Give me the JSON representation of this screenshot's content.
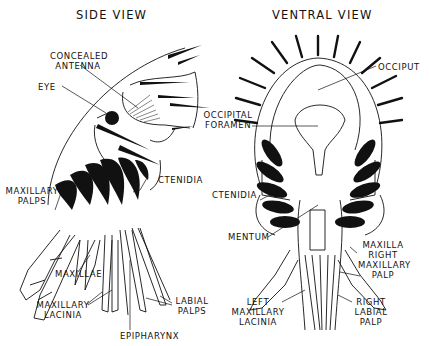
{
  "titles": {
    "side": "SIDE VIEW",
    "ventral": "VENTRAL VIEW"
  },
  "side_labels": {
    "concealed_antenna_1": "CONCEALED",
    "concealed_antenna_2": "ANTENNA",
    "eye": "EYE",
    "ctenidia": "CTENIDIA",
    "maxillary_palps_1": "MAXILLARY",
    "maxillary_palps_2": "PALPS",
    "maxillae": "MAXILLAE",
    "maxillary_lacinia_1": "MAXILLARY",
    "maxillary_lacinia_2": "LACINIA",
    "epipharynx": "EPIPHARYNX",
    "labial_palps_1": "LABIAL",
    "labial_palps_2": "PALPS"
  },
  "ventral_labels": {
    "occiput": "OCCIPUT",
    "occipital_foramen_1": "OCCIPITAL",
    "occipital_foramen_2": "FORAMEN",
    "ctenidia": "CTENIDIA",
    "mentum": "MENTUM",
    "maxilla": "MAXILLA",
    "right_maxillary_palp_1": "RIGHT",
    "right_maxillary_palp_2": "MAXILLARY",
    "right_maxillary_palp_3": "PALP",
    "left_maxillary_lacinia_1": "LEFT",
    "left_maxillary_lacinia_2": "MAXILLARY",
    "left_maxillary_lacinia_3": "LACINIA",
    "right_labial_palp_1": "RIGHT",
    "right_labial_palp_2": "LABIAL",
    "right_labial_palp_3": "PALP"
  }
}
